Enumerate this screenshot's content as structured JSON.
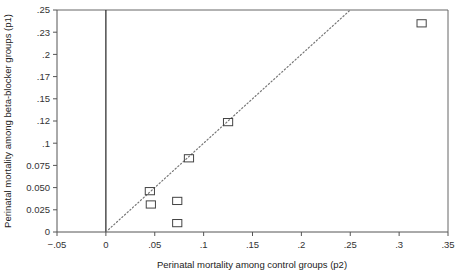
{
  "chart_data": {
    "type": "scatter",
    "title": "",
    "xlabel": "Perinatal mortality among control groups (p2)",
    "ylabel": "Perinatal mortality among beta-blocker groups (p1)",
    "xlim": [
      -0.05,
      0.35
    ],
    "ylim": [
      0,
      0.25
    ],
    "grid": false,
    "legend": null,
    "x_ticks": [
      {
        "value": -0.05,
        "label": "−.05"
      },
      {
        "value": 0,
        "label": "0"
      },
      {
        "value": 0.05,
        "label": ".05"
      },
      {
        "value": 0.1,
        "label": ".1"
      },
      {
        "value": 0.15,
        "label": ".15"
      },
      {
        "value": 0.2,
        "label": ".2"
      },
      {
        "value": 0.25,
        "label": ".25"
      },
      {
        "value": 0.3,
        "label": ".3"
      },
      {
        "value": 0.35,
        "label": ".35"
      }
    ],
    "y_ticks": [
      {
        "value": 0,
        "label": "0"
      },
      {
        "value": 0.025,
        "label": "0.025"
      },
      {
        "value": 0.05,
        "label": "0.050"
      },
      {
        "value": 0.075,
        "label": "0.075"
      },
      {
        "value": 0.1,
        "label": ".1"
      },
      {
        "value": 0.12,
        "label": ".12"
      },
      {
        "value": 0.15,
        "label": ".15"
      },
      {
        "value": 0.17,
        "label": ".17"
      },
      {
        "value": 0.2,
        "label": ".2"
      },
      {
        "value": 0.23,
        "label": ".23"
      },
      {
        "value": 0.25,
        "label": ".25"
      }
    ],
    "points": [
      {
        "x": 0.045,
        "y": 0.046
      },
      {
        "x": 0.046,
        "y": 0.031
      },
      {
        "x": 0.073,
        "y": 0.035
      },
      {
        "x": 0.073,
        "y": 0.01
      },
      {
        "x": 0.085,
        "y": 0.083
      },
      {
        "x": 0.125,
        "y": 0.119
      },
      {
        "x": 0.323,
        "y": 0.238
      }
    ],
    "reference_line": {
      "style": "dotted",
      "description": "line of equality p1 = p2",
      "from": {
        "x": 0,
        "y": 0
      },
      "to": {
        "x": 0.25,
        "y": 0.25
      }
    },
    "vertical_rule": {
      "x": 0,
      "style": "solid"
    },
    "marker": "open-square",
    "colors": {
      "axis": "#555555",
      "marker_stroke": "#444444",
      "reference_line": "#777777",
      "background": "#ffffff",
      "text": "#2b2b2b"
    }
  }
}
